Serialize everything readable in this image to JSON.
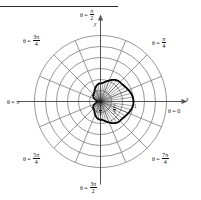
{
  "figure": {
    "type": "polar-grid-plot",
    "background": "#ffffff",
    "grid_color": "#6e6e6e",
    "curve_color": "#000000",
    "axis_color": "#555555",
    "text_color": "#111111"
  },
  "axes": {
    "x_label": "x",
    "y_label": "y"
  },
  "angle_labels": [
    {
      "name": "theta-0",
      "text": "θ = 0",
      "frac": null,
      "deg": 0
    },
    {
      "name": "theta-pi-4",
      "text": "θ = ",
      "frac": {
        "num": "π",
        "den": "4"
      },
      "deg": 45
    },
    {
      "name": "theta-pi-2",
      "text": "θ = ",
      "frac": {
        "num": "π",
        "den": "2"
      },
      "deg": 90
    },
    {
      "name": "theta-3pi-4",
      "text": "θ = ",
      "frac": {
        "num": "3π",
        "den": "4"
      },
      "deg": 135
    },
    {
      "name": "theta-pi",
      "text": "θ = π",
      "frac": null,
      "deg": 180
    },
    {
      "name": "theta-5pi-4",
      "text": "θ = ",
      "frac": {
        "num": "5π",
        "den": "4"
      },
      "deg": 225
    },
    {
      "name": "theta-3pi-2",
      "text": "θ = ",
      "frac": {
        "num": "3π",
        "den": "2"
      },
      "deg": 270
    },
    {
      "name": "theta-7pi-4",
      "text": "θ = ",
      "frac": {
        "num": "7π",
        "den": "4"
      },
      "deg": 315
    }
  ],
  "radial_labels": [
    {
      "name": "r-one-third",
      "num": "1",
      "den": "3",
      "whole": null
    },
    {
      "name": "r-two-thirds",
      "num": "2",
      "den": "3",
      "whole": null
    },
    {
      "name": "r-one",
      "num": null,
      "den": null,
      "whole": "1"
    }
  ],
  "chart_data": {
    "type": "line",
    "title": "",
    "xlabel": "x",
    "ylabel": "y",
    "coordinate_system": "polar",
    "grid": true,
    "legend": false,
    "rlim": [
      0,
      2
    ],
    "theta_ticks_deg": [
      0,
      22.5,
      45,
      67.5,
      90,
      112.5,
      135,
      157.5,
      180,
      202.5,
      225,
      247.5,
      270,
      292.5,
      315,
      337.5
    ],
    "r_gridlines": [
      0.333,
      0.667,
      1.0,
      1.333,
      1.667,
      2.0
    ],
    "r_tick_labels": [
      "1/3",
      "2/3",
      "1"
    ],
    "series": [
      {
        "name": "curve",
        "equation_form": "r = a / (1 + e*cos(theta)) style closed oval",
        "closed": true,
        "bold": true,
        "r_at_theta_deg": {
          "0": 1.0,
          "45": 0.83,
          "90": 0.55,
          "135": 0.3,
          "180": 0.06,
          "225": 0.3,
          "270": 0.55,
          "315": 0.83
        }
      }
    ]
  }
}
